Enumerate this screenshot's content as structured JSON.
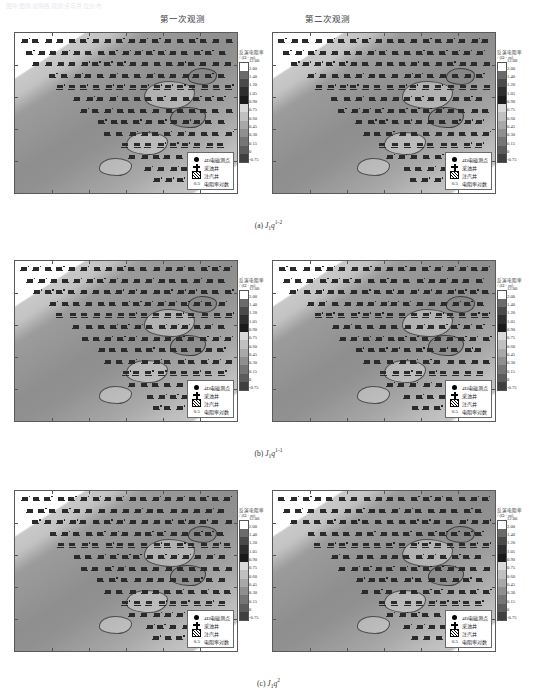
{
  "figure": {
    "header_note": "图中图例说明各观测点与井位分布",
    "column_headers": [
      "第一次观测",
      "第二次观测"
    ],
    "row_captions": [
      {
        "label": "(a)",
        "formation": "J",
        "sub": "1",
        "unit": "q",
        "sup": "1-2"
      },
      {
        "label": "(b)",
        "formation": "J",
        "sub": "1",
        "unit": "q",
        "sup": "1-1"
      },
      {
        "label": "(c)",
        "formation": "J",
        "sub": "1",
        "unit": "q",
        "sup": "2"
      }
    ]
  },
  "colorbar": {
    "title_line1": "反演电阻率",
    "title_line2": "/ (Ω · m)",
    "labels": [
      "12.00",
      "2.00",
      "1.40",
      "1.20",
      "1.05",
      "0.90",
      "0.75",
      "0.60",
      "0.45",
      "0.30",
      "0.15",
      "0",
      "-0.75"
    ],
    "colors": [
      "#ffffff",
      "#6b6b6b",
      "#4a4a4a",
      "#2e2e2e",
      "#1a1a1a",
      "#d9d9d9",
      "#c0c0c0",
      "#a8a8a8",
      "#8f8f8f",
      "#757575",
      "#5c5c5c",
      "#3f3f3f"
    ]
  },
  "legend": {
    "items": [
      {
        "symbol": "filled-circle",
        "label": "4D电磁测点"
      },
      {
        "symbol": "plus-cross",
        "label": "采油井"
      },
      {
        "symbol": "hatched-square",
        "label": "注汽井"
      },
      {
        "symbol": "number",
        "label": "电阻率对数",
        "value": "0.5"
      }
    ]
  },
  "chart_data": {
    "type": "heatmap",
    "panels": [
      {
        "row": "(a)",
        "layer": "J1q1-2",
        "column": "第一次观测"
      },
      {
        "row": "(a)",
        "layer": "J1q1-2",
        "column": "第二次观测"
      },
      {
        "row": "(b)",
        "layer": "J1q1-1",
        "column": "第一次观测"
      },
      {
        "row": "(b)",
        "layer": "J1q1-1",
        "column": "第二次观测"
      },
      {
        "row": "(c)",
        "layer": "J1q2",
        "column": "第一次观测"
      },
      {
        "row": "(c)",
        "layer": "J1q2",
        "column": "第二次观测"
      }
    ],
    "colorbar_label": "反演电阻率 / (Ω · m)",
    "colorbar_ticks": [
      12.0,
      2.0,
      1.4,
      1.2,
      1.05,
      0.9,
      0.75,
      0.6,
      0.45,
      0.3,
      0.15,
      0,
      -0.75
    ],
    "zlim": [
      -0.75,
      12.0
    ],
    "grid": false,
    "legend_position": "inside-bottom-right"
  }
}
